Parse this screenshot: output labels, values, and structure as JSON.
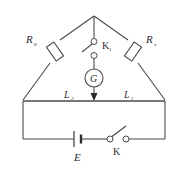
{
  "diagram": {
    "line_color": "#4a4a4a",
    "text_color": "#2b2b2b",
    "background": "#ffffff",
    "components": {
      "resistor_left": {
        "symbol": "R",
        "subscript": "0",
        "name": "standard-resistor"
      },
      "resistor_right": {
        "symbol": "R",
        "subscript": "x",
        "name": "unknown-resistor"
      },
      "switch_bridge": {
        "symbol": "K",
        "subscript": "1",
        "name": "galvanometer-switch"
      },
      "galvanometer": {
        "symbol": "G",
        "name": "galvanometer"
      },
      "wire_left": {
        "symbol": "L",
        "subscript": "2",
        "name": "left-wire-segment"
      },
      "wire_right": {
        "symbol": "L",
        "subscript": "1",
        "name": "right-wire-segment"
      },
      "battery": {
        "symbol": "E",
        "name": "battery"
      },
      "switch_main": {
        "symbol": "K",
        "subscript": "",
        "name": "main-switch"
      }
    }
  }
}
